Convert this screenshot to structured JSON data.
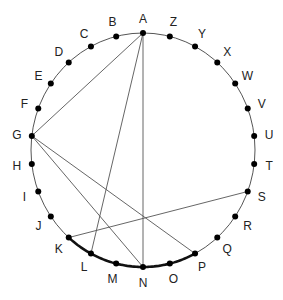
{
  "diagram": {
    "title": "",
    "circle": {
      "cx": 143,
      "cy": 150,
      "rx": 112,
      "ry": 117,
      "stroke": "#555555"
    },
    "points": [
      "A",
      "B",
      "C",
      "D",
      "E",
      "F",
      "G",
      "H",
      "I",
      "J",
      "K",
      "L",
      "M",
      "N",
      "O",
      "P",
      "Q",
      "R",
      "S",
      "T",
      "U",
      "V",
      "W",
      "X",
      "Y",
      "Z"
    ],
    "chords": [
      [
        "A",
        "G"
      ],
      [
        "A",
        "L"
      ],
      [
        "A",
        "N"
      ],
      [
        "G",
        "N"
      ],
      [
        "G",
        "P"
      ],
      [
        "K",
        "S"
      ]
    ],
    "highlighted_arc": {
      "from": "K",
      "to": "P",
      "through": [
        "L",
        "M",
        "N",
        "O"
      ],
      "color": "#111111"
    },
    "colors": {
      "dot": "#000000",
      "chord": "#555555",
      "label": "#222222"
    }
  }
}
